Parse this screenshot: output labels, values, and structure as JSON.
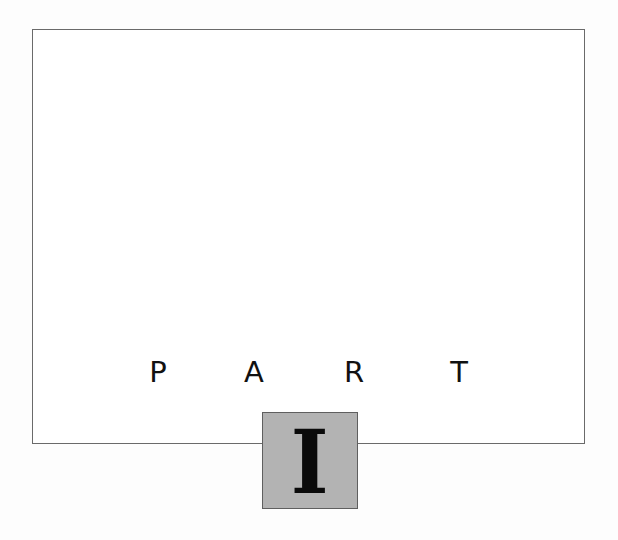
{
  "part_title": {
    "letters": [
      "P",
      "A",
      "R",
      "T"
    ],
    "numeral": "I"
  },
  "colors": {
    "frame_border": "#6a6a6a",
    "box_fill": "#b3b3b3",
    "box_border": "#5f5f5f",
    "text": "#111111"
  }
}
